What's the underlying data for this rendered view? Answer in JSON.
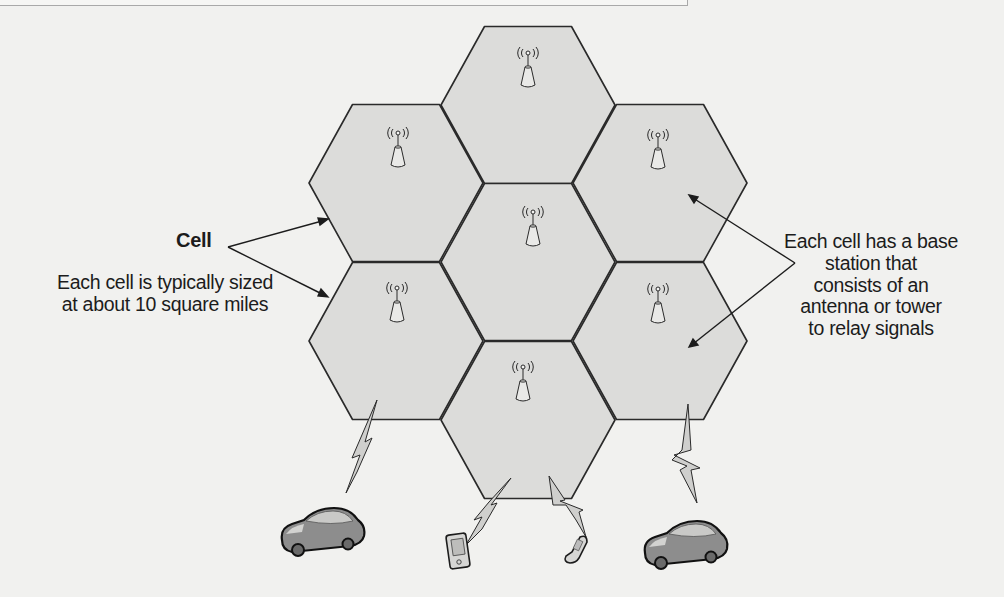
{
  "diagram": {
    "labels": {
      "cell": "Cell",
      "cell_size_line1": "Each cell is typically sized",
      "cell_size_line2": "at about 10 square miles",
      "base_station_line1": "Each cell has a base",
      "base_station_line2": "station that",
      "base_station_line3": "consists of an",
      "base_station_line4": "antenna or tower",
      "base_station_line5": "to relay signals"
    },
    "cells": [
      {
        "id": "top",
        "cx": 528,
        "cy": 105,
        "has_antenna": true
      },
      {
        "id": "upper-left",
        "cx": 396,
        "cy": 183,
        "has_antenna": true
      },
      {
        "id": "upper-right",
        "cx": 660,
        "cy": 183,
        "has_antenna": true
      },
      {
        "id": "center",
        "cx": 528,
        "cy": 262,
        "has_antenna": true
      },
      {
        "id": "lower-left",
        "cx": 396,
        "cy": 341,
        "has_antenna": true
      },
      {
        "id": "lower-right",
        "cx": 660,
        "cy": 341,
        "has_antenna": true
      },
      {
        "id": "bottom",
        "cx": 528,
        "cy": 420,
        "has_antenna": true
      }
    ],
    "devices": [
      {
        "type": "car",
        "x": 322,
        "y": 530
      },
      {
        "type": "pda",
        "x": 459,
        "y": 562
      },
      {
        "type": "flip-phone",
        "x": 575,
        "y": 555
      },
      {
        "type": "car",
        "x": 682,
        "y": 542
      }
    ],
    "colors": {
      "background": "#f1f1ef",
      "cell_fill": "#dcdcda",
      "cell_stroke": "#2a2a2a",
      "text": "#1c1c1c",
      "antenna_fill": "#e4e4e2",
      "car_body": "#8d8d8d",
      "bolt_fill": "#cfcfcd"
    }
  }
}
